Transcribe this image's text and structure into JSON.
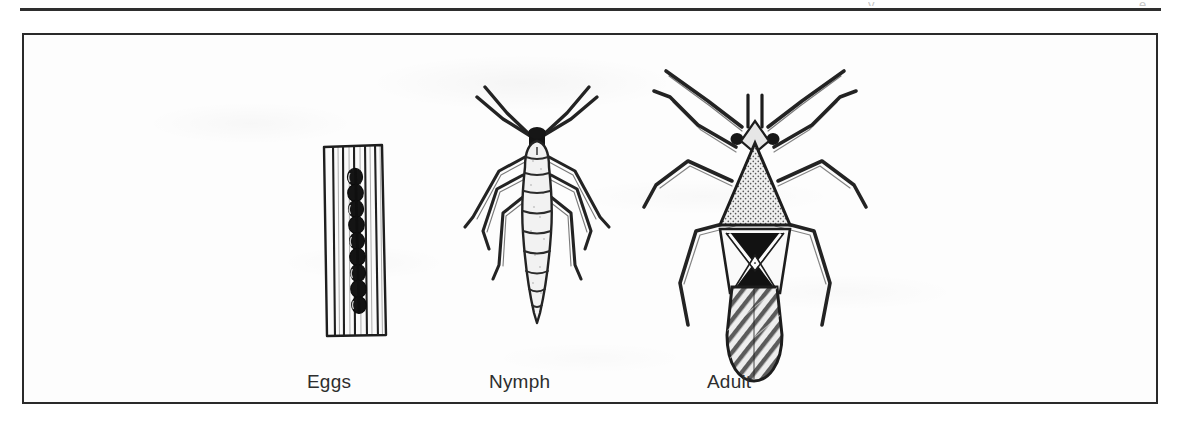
{
  "page": {
    "background_color": "#ffffff",
    "rule_color": "#1c1c1c",
    "running_head_fragment_left": "y",
    "running_head_fragment_right": "e"
  },
  "figure": {
    "frame_color": "#2a2a2a",
    "frame_fill": "#fdfdfd",
    "ink_color": "#222222",
    "panels": [
      {
        "id": "eggs",
        "label": "Eggs",
        "icon": "insect-eggs-in-grass-blade-illustration",
        "description": "Row of dark oval eggs inserted in a striated grass blade"
      },
      {
        "id": "nymph",
        "label": "Nymph",
        "icon": "insect-nymph-illustration",
        "description": "Wingless segmented nymph with two antennae and six legs"
      },
      {
        "id": "adult",
        "label": "Adult",
        "icon": "insect-adult-illustration",
        "description": "Adult bug with triangular stippled pronotum, black X marking on wings and hatched wing membrane"
      }
    ]
  }
}
